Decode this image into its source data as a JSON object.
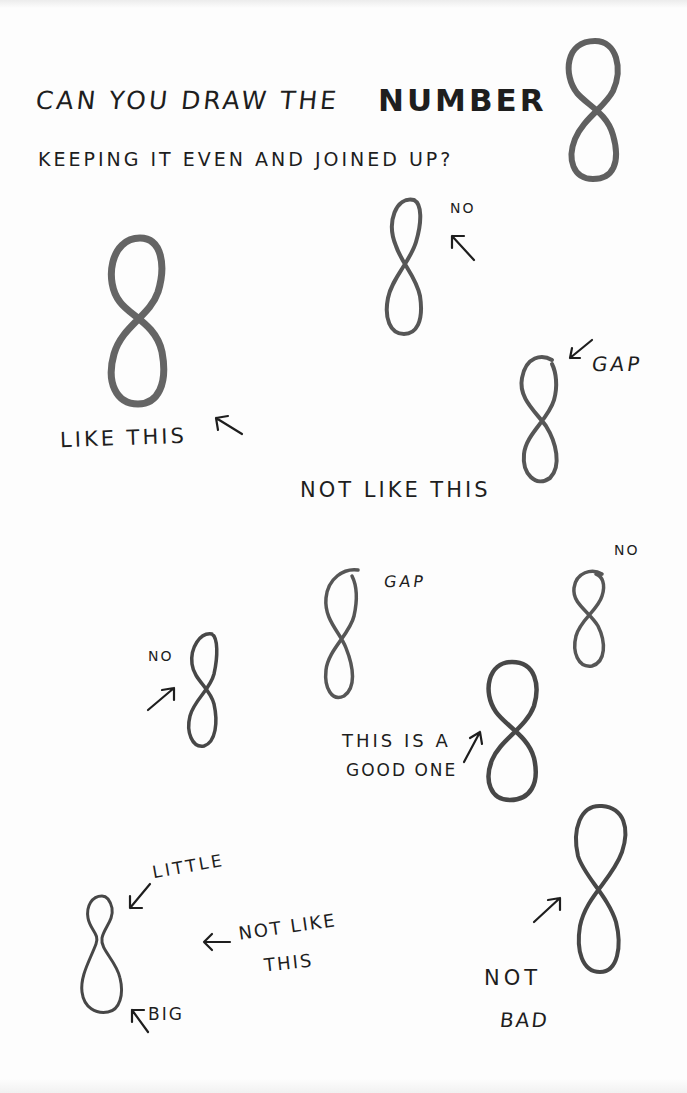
{
  "worksheet": {
    "title_line1_part1": "CAN YOU DRAW THE",
    "title_line1_part2": "NUMBER",
    "title_line2": "KEEPING IT EVEN AND JOINED UP?",
    "paper_color": "#fdfdfd",
    "pencil_color": "#3a3a3a"
  },
  "examples": [
    {
      "id": "hero",
      "label": "",
      "verdict": "example"
    },
    {
      "id": "good-large",
      "label": "LIKE THIS",
      "verdict": "good"
    },
    {
      "id": "narrow-top",
      "label": "NO",
      "verdict": "bad"
    },
    {
      "id": "gap-top-right",
      "label": "GAP",
      "caption": "NOT LIKE THIS",
      "verdict": "bad"
    },
    {
      "id": "small-no",
      "label": "NO",
      "verdict": "bad"
    },
    {
      "id": "gap-middle",
      "label": "GAP",
      "verdict": "bad"
    },
    {
      "id": "small-no-right",
      "label": "NO",
      "verdict": "bad"
    },
    {
      "id": "good-one",
      "label_line1": "THIS IS A",
      "label_line2": "GOOD ONE",
      "verdict": "good"
    },
    {
      "id": "little-big",
      "label_top": "LITTLE",
      "label_bottom": "BIG",
      "caption_line1": "NOT LIKE",
      "caption_line2": "THIS",
      "verdict": "bad"
    },
    {
      "id": "not-bad",
      "label_line1": "NOT",
      "label_line2": "BAD",
      "verdict": "ok"
    }
  ]
}
